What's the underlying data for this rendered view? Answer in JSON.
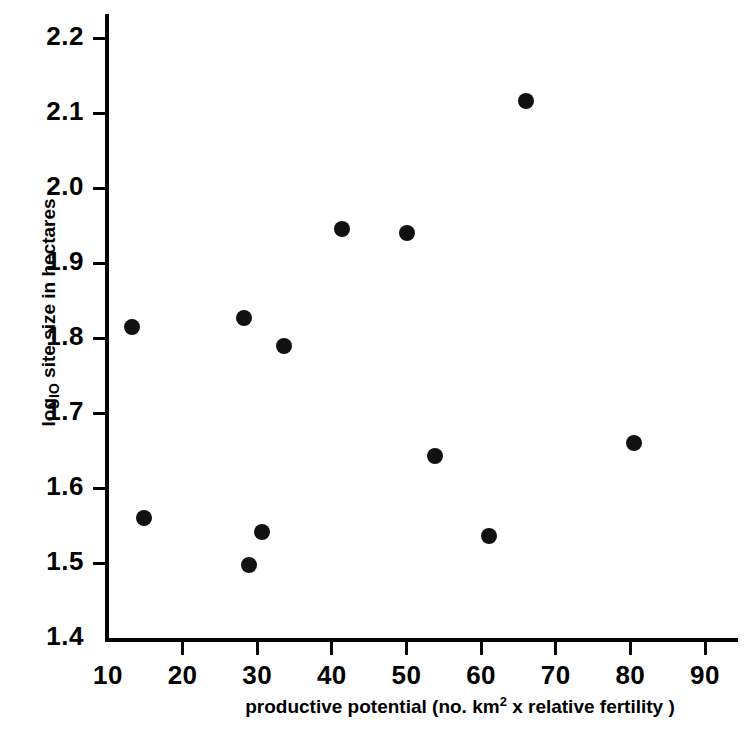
{
  "chart_data": {
    "type": "scatter",
    "title": "",
    "xlabel": "productive potential (no. km2 x relative fertility)",
    "xlabel_parts": {
      "before": "productive potential (no. km",
      "superscript": "2",
      "after": " x relative fertility )"
    },
    "ylabel": "log10 site size in hectares",
    "ylabel_parts": {
      "before": "log",
      "subscript": "IO",
      "after": " site size in hectares"
    },
    "xlim": [
      10,
      90
    ],
    "ylim": [
      1.4,
      2.2
    ],
    "xticks": [
      10,
      20,
      30,
      40,
      50,
      60,
      70,
      80,
      90
    ],
    "xtick_labels": [
      "10",
      "20",
      "30",
      "40",
      "50",
      "60",
      "70",
      "80",
      "90"
    ],
    "yticks": [
      1.4,
      1.5,
      1.6,
      1.7,
      1.8,
      1.9,
      2.0,
      2.1,
      2.2
    ],
    "ytick_labels": [
      "1.4",
      "1.5",
      "1.6",
      "1.7",
      "1.8",
      "1.9",
      "2.0",
      "2.1",
      "2.2"
    ],
    "grid": false,
    "legend": null,
    "marker": "filled-circle",
    "marker_color": "#111111",
    "axis_color": "#000000",
    "background_color": "#ffffff",
    "points": [
      {
        "x": 13.2,
        "y": 1.815
      },
      {
        "x": 14.8,
        "y": 1.56
      },
      {
        "x": 28.2,
        "y": 1.827
      },
      {
        "x": 28.9,
        "y": 1.497
      },
      {
        "x": 30.7,
        "y": 1.542
      },
      {
        "x": 33.6,
        "y": 1.789
      },
      {
        "x": 41.3,
        "y": 1.946
      },
      {
        "x": 50.0,
        "y": 1.94
      },
      {
        "x": 53.8,
        "y": 1.643
      },
      {
        "x": 61.0,
        "y": 1.536
      },
      {
        "x": 66.0,
        "y": 2.116
      },
      {
        "x": 80.5,
        "y": 1.66
      }
    ]
  }
}
